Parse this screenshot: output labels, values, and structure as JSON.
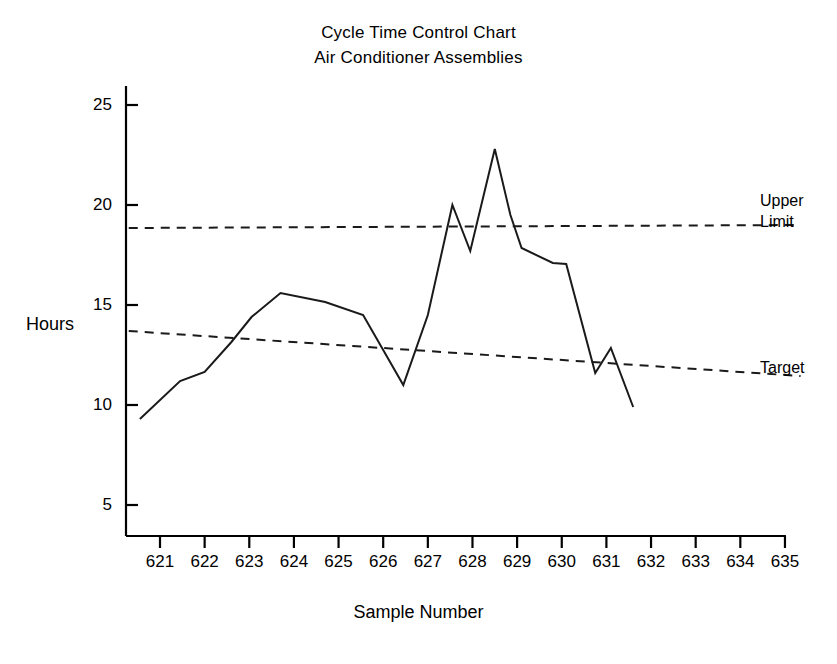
{
  "chart_data": {
    "type": "line",
    "title": "Cycle Time Control Chart",
    "subtitle": "Air Conditioner Assemblies",
    "xlabel": "Sample Number",
    "ylabel": "Hours",
    "grid": false,
    "legend_position": "right-inline",
    "xlim": [
      620.25,
      635.4
    ],
    "ylim": [
      3.3,
      26.2
    ],
    "xticks": [
      621,
      622,
      623,
      624,
      625,
      626,
      627,
      628,
      629,
      630,
      631,
      632,
      633,
      634,
      635
    ],
    "xtick_labels": [
      "621",
      "622",
      "623",
      "624",
      "625",
      "626",
      "627",
      "628",
      "629",
      "630",
      "631",
      "632",
      "633",
      "634",
      "635"
    ],
    "yticks": [
      5,
      10,
      15,
      20,
      25
    ],
    "ytick_labels": [
      "5",
      "10",
      "15",
      "20",
      "25"
    ],
    "series": [
      {
        "name": "Cycle Time",
        "style": "solid",
        "color": "#1a1a1a",
        "x": [
          620.55,
          621.45,
          622.0,
          622.6,
          623.05,
          623.7,
          624.7,
          625.55,
          626.0,
          626.45,
          627.0,
          627.55,
          627.95,
          628.5,
          628.85,
          629.1,
          629.8,
          630.1,
          630.75,
          631.1,
          631.6
        ],
        "y": [
          9.3,
          11.2,
          11.65,
          13.15,
          14.4,
          15.6,
          15.15,
          14.5,
          12.75,
          11.0,
          14.5,
          20.0,
          17.7,
          22.8,
          19.5,
          17.85,
          17.1,
          17.05,
          11.6,
          12.85,
          9.9
        ]
      },
      {
        "name": "Upper Limit",
        "style": "dashed",
        "color": "#1a1a1a",
        "x": [
          620.3,
          635.35
        ],
        "y": [
          18.85,
          19.0
        ]
      },
      {
        "name": "Target",
        "style": "dashed",
        "color": "#1a1a1a",
        "x": [
          620.3,
          635.35
        ],
        "y": [
          13.7,
          11.45
        ]
      }
    ],
    "annotations": [
      {
        "name": "upper-limit",
        "text_line1": "Upper",
        "text_line2": "Limit",
        "x": 635.4,
        "y": 19.6
      },
      {
        "name": "target",
        "text_line1": "Target",
        "text_line2": "",
        "x": 635.4,
        "y": 11.5
      }
    ]
  },
  "axes": {
    "y_label": "Hours",
    "x_label": "Sample Number"
  },
  "title": {
    "line1": "Cycle Time Control Chart",
    "line2": "Air Conditioner Assemblies"
  },
  "colors": {
    "background": "#ffffff",
    "ink": "#1a1a1a",
    "axis": "#000000"
  }
}
